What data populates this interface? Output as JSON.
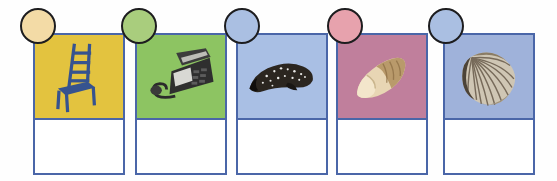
{
  "worksheet": {
    "title": "picture word worksheet",
    "description": "Row of five picture cards with colored circle bullets and blank answer boxes",
    "card_border_color": "#4a66a8",
    "answer_box_color": "#ffffff",
    "background": "#fefefe",
    "cards": [
      {
        "id": "card-1",
        "picture_name": "chair",
        "icon_name": "chair-icon",
        "picture_background": "#e3c33f",
        "badge_name": "bullet-circle-1",
        "badge_color": "#f3dba6",
        "badge_outline": "#1d1d1f",
        "answer_value": "",
        "answer_placeholder": "",
        "left": 33,
        "badge_left": 20
      },
      {
        "id": "card-2",
        "picture_name": "telephone",
        "icon_name": "telephone-icon",
        "picture_background": "#8dc462",
        "badge_name": "bullet-circle-2",
        "badge_color": "#a9cd7d",
        "badge_outline": "#1d1d1f",
        "answer_value": "",
        "answer_placeholder": "",
        "left": 135,
        "badge_left": 121
      },
      {
        "id": "card-3",
        "picture_name": "whale",
        "icon_name": "whale-icon",
        "picture_background": "#a9bfe4",
        "badge_name": "bullet-circle-3",
        "badge_color": "#aabfe2",
        "badge_outline": "#1d1d1f",
        "answer_value": "",
        "answer_placeholder": "",
        "left": 236,
        "badge_left": 224
      },
      {
        "id": "card-4",
        "picture_name": "thumb",
        "icon_name": "thumb-icon",
        "picture_background": "#c07f9c",
        "badge_name": "bullet-circle-4",
        "badge_color": "#e7a2ad",
        "badge_outline": "#1d1d1f",
        "answer_value": "",
        "answer_placeholder": "",
        "left": 336,
        "badge_left": 327
      },
      {
        "id": "card-5",
        "picture_name": "shell",
        "icon_name": "shell-icon",
        "picture_background": "#9fb2da",
        "badge_name": "bullet-circle-5",
        "badge_color": "#aabfe2",
        "badge_outline": "#1d1d1f",
        "answer_value": "",
        "answer_placeholder": "",
        "left": 443,
        "badge_left": 428
      }
    ]
  }
}
